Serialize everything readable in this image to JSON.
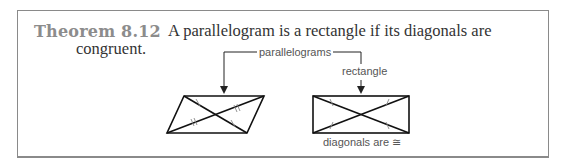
{
  "theorem": {
    "number_label": "Theorem 8.12",
    "statement_line1": "A parallelogram is a rectangle if its diagonals are",
    "statement_line2": "congruent."
  },
  "figure": {
    "callout_label": "parallelograms",
    "rectangle_label": "rectangle",
    "caption": "diagonals are ≅",
    "shapes": [
      {
        "name": "parallelogram",
        "diagonal_marks": "single and double tick marks (congruent halves)"
      },
      {
        "name": "rectangle",
        "diagonal_marks": "single tick marks on all four halves (diagonals congruent)"
      }
    ]
  },
  "colors": {
    "heading": "#8c8c8c",
    "text": "#333333",
    "border": "#8a8a8a",
    "lines": "#111111"
  }
}
